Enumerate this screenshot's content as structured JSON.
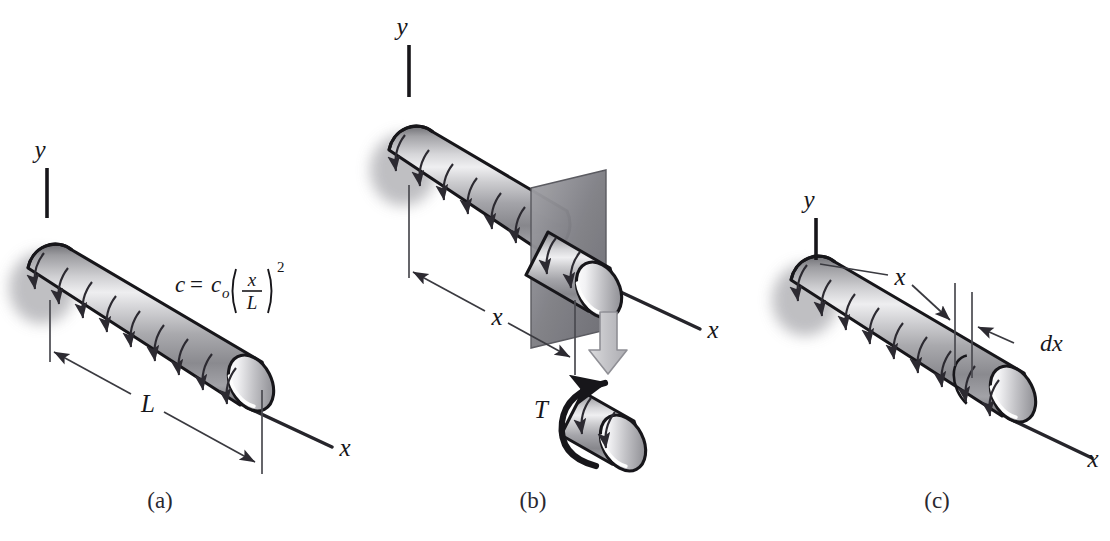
{
  "figure": {
    "background_color": "#ffffff",
    "ink_color": "#17161a",
    "line_color": "#3a3a40",
    "shadow_color": "#b9b9bd",
    "cut_plane_color": "#8d8d92",
    "block_arrow_color": "#c9c9cc"
  },
  "panels": [
    {
      "id": "a",
      "caption": "(a)",
      "axis_y_label": "y",
      "axis_x_label": "x",
      "dimension_label": "L",
      "equation": {
        "lhs": "c",
        "equals": "=",
        "coefficient": "c",
        "coefficient_subscript": "o",
        "fraction_numerator": "x",
        "fraction_denominator": "L",
        "exponent": "2"
      }
    },
    {
      "id": "b",
      "caption": "(b)",
      "axis_y_label": "y",
      "axis_x_label": "x",
      "dimension_label": "x",
      "torque_label": "T",
      "cut_plane_name": "section-cut-plane",
      "transfer_arrow_name": "down-block-arrow"
    },
    {
      "id": "c",
      "caption": "(c)",
      "axis_y_label": "y",
      "axis_x_label": "x",
      "dimension_label": "x",
      "element_label": "dx"
    }
  ]
}
